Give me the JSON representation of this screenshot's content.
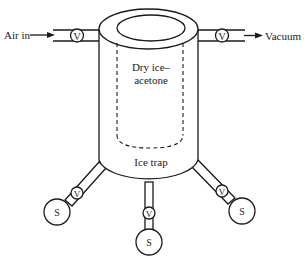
{
  "diagram": {
    "labels": {
      "air_in": "Air in",
      "vacuum": "Vacuum",
      "coolant_line1": "Dry ice–",
      "coolant_line2": "acetone",
      "ice_trap": "Ice trap"
    },
    "valve_symbol": "V",
    "sample_symbol": "S",
    "components": {
      "inlet_valve": "V",
      "outlet_valve": "V",
      "left_flask_valve": "V",
      "center_flask_valve": "V",
      "right_flask_valve": "V",
      "left_flask": "S",
      "center_flask": "S",
      "right_flask": "S"
    },
    "colors": {
      "line": "#1a1a1a",
      "background": "#ffffff"
    }
  }
}
